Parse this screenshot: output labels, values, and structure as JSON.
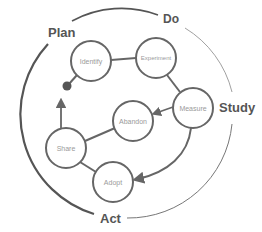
{
  "phases": {
    "plan": "Plan",
    "do": "Do",
    "study": "Study",
    "act": "Act"
  },
  "nodes": {
    "identify": "Identify",
    "experiment": "Experiment",
    "measure": "Measure",
    "abandon": "Abandon",
    "share": "Share",
    "adopt": "Adopt"
  },
  "colors": {
    "stroke": "#666666",
    "outer_thin": "#888888",
    "label": "#555555",
    "node_text": "#9a9a9a"
  }
}
